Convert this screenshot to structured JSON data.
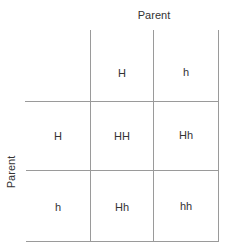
{
  "diagram": {
    "type": "punnett-square",
    "top_axis_label": "Parent",
    "side_axis_label": "Parent",
    "column_headers": [
      "H",
      "h"
    ],
    "row_headers": [
      "H",
      "h"
    ],
    "cells": [
      [
        "HH",
        "Hh"
      ],
      [
        "Hh",
        "hh"
      ]
    ],
    "colors": {
      "grid_lines": "#9a9a9a",
      "text": "#333333",
      "background": "#ffffff"
    }
  }
}
